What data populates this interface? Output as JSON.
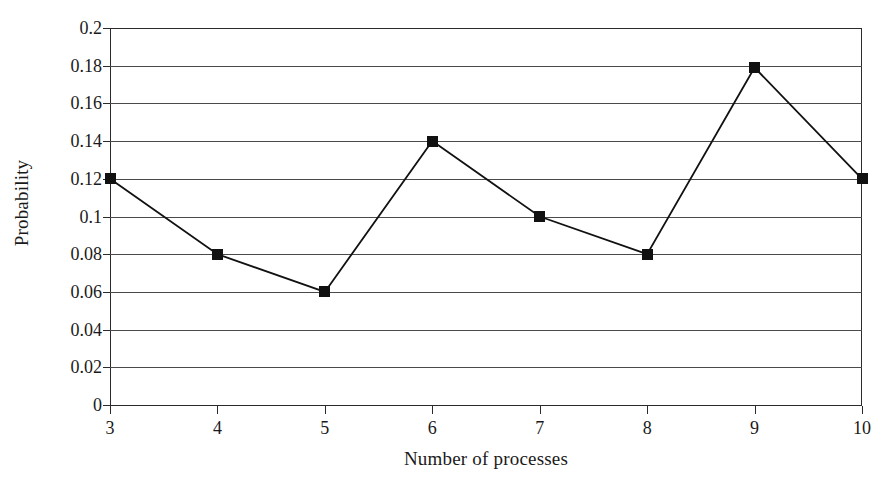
{
  "chart_data": {
    "type": "line",
    "title": "",
    "xlabel": "Number of processes",
    "ylabel": "Probability",
    "x": [
      3,
      4,
      5,
      6,
      7,
      8,
      9,
      10
    ],
    "values": [
      0.12,
      0.08,
      0.06,
      0.14,
      0.1,
      0.08,
      0.179,
      0.12
    ],
    "series": [
      {
        "name": "Probability",
        "values": [
          0.12,
          0.08,
          0.06,
          0.14,
          0.1,
          0.08,
          0.179,
          0.12
        ]
      }
    ],
    "xtick_labels": [
      "3",
      "4",
      "5",
      "6",
      "7",
      "8",
      "9",
      "10"
    ],
    "ytick_labels": [
      "0",
      "0.02",
      "0.04",
      "0.06",
      "0.08",
      "0.1",
      "0.12",
      "0.14",
      "0.16",
      "0.18",
      "0.2"
    ],
    "ytick_values": [
      0,
      0.02,
      0.04,
      0.06,
      0.08,
      0.1,
      0.12,
      0.14,
      0.16,
      0.18,
      0.2
    ],
    "xlim": [
      3,
      10
    ],
    "ylim": [
      0,
      0.2
    ],
    "grid": "horizontal",
    "legend": "none",
    "marker": "filled-square",
    "line_color": "#111111",
    "marker_color": "#111111",
    "grid_color": "#4a4a4a",
    "axis_color": "#2b2b2b",
    "background": "#ffffff"
  }
}
